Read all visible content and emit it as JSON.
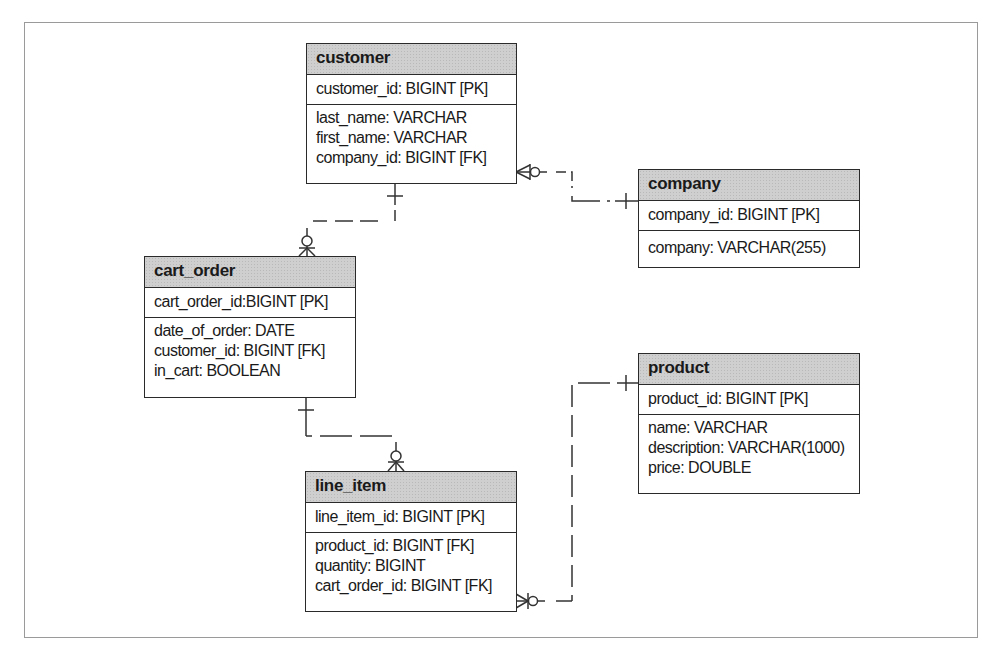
{
  "diagram": {
    "type": "entity-relationship",
    "entities": {
      "customer": {
        "name": "customer",
        "pk": "customer_id: BIGINT [PK]",
        "attributes": [
          "last_name: VARCHAR",
          "first_name: VARCHAR",
          "company_id: BIGINT [FK]"
        ]
      },
      "company": {
        "name": "company",
        "pk": "company_id: BIGINT [PK]",
        "attributes": [
          "company: VARCHAR(255)"
        ]
      },
      "cart_order": {
        "name": "cart_order",
        "pk": "cart_order_id:BIGINT [PK]",
        "attributes": [
          "date_of_order: DATE",
          "customer_id: BIGINT [FK]",
          "in_cart: BOOLEAN"
        ]
      },
      "product": {
        "name": "product",
        "pk": "product_id: BIGINT [PK]",
        "attributes": [
          "name: VARCHAR",
          "description: VARCHAR(1000)",
          "price: DOUBLE"
        ]
      },
      "line_item": {
        "name": "line_item",
        "pk": "line_item_id: BIGINT [PK]",
        "attributes": [
          "product_id: BIGINT [FK]",
          "quantity: BIGINT",
          "cart_order_id: BIGINT [FK]"
        ]
      }
    },
    "relationships": [
      {
        "from": "company",
        "from_cardinality": "one",
        "to": "customer",
        "to_cardinality": "zero-or-many"
      },
      {
        "from": "customer",
        "from_cardinality": "one",
        "to": "cart_order",
        "to_cardinality": "zero-or-many"
      },
      {
        "from": "cart_order",
        "from_cardinality": "one",
        "to": "line_item",
        "to_cardinality": "zero-or-many"
      },
      {
        "from": "product",
        "from_cardinality": "one",
        "to": "line_item",
        "to_cardinality": "zero-or-many"
      }
    ],
    "colors": {
      "header_fill": "#cfcfcf",
      "border": "#2a2a2a",
      "connector": "#333333",
      "frame": "#9a9a9a"
    }
  }
}
